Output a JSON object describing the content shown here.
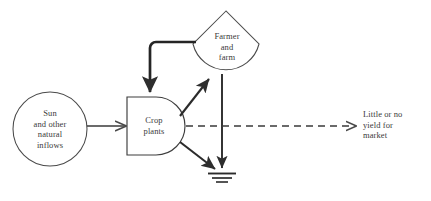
{
  "diagram": {
    "type": "energy-systems-language",
    "background_color": "#ffffff",
    "line_color": "#2e2e2e",
    "text_color": "#3a3a3a",
    "nodes": [
      {
        "id": "source",
        "symbol": "circle-source",
        "label": "Sun\nand other\nnatural\ninflows",
        "lines": [
          "Sun",
          "and other",
          "natural",
          "inflows"
        ]
      },
      {
        "id": "producer",
        "symbol": "bullet-producer",
        "label": "Crop\nplants",
        "lines": [
          "Crop",
          "plants"
        ]
      },
      {
        "id": "consumer",
        "symbol": "hexagon-consumer",
        "label": "Farmer\nand\nfarm",
        "lines": [
          "Farmer",
          "and",
          "farm"
        ]
      },
      {
        "id": "heat-sink",
        "symbol": "ground-heat-sink",
        "label": ""
      },
      {
        "id": "yield",
        "symbol": "text-label",
        "label": "Little or no\nyield for\nmarket",
        "lines": [
          "Little or no",
          "yield for",
          "market"
        ]
      }
    ],
    "flows": [
      {
        "id": "source-to-producer",
        "from": "source",
        "to": "producer",
        "style": "solid",
        "arrow": true
      },
      {
        "id": "producer-to-consumer",
        "from": "producer",
        "to": "consumer",
        "style": "solid",
        "arrow": true
      },
      {
        "id": "consumer-feedback-to-producer",
        "from": "consumer",
        "to": "producer",
        "style": "solid-thick",
        "arrow": true
      },
      {
        "id": "producer-to-heat-sink",
        "from": "producer",
        "to": "heat-sink",
        "style": "solid",
        "arrow": true
      },
      {
        "id": "consumer-to-heat-sink",
        "from": "consumer",
        "to": "heat-sink",
        "style": "solid",
        "arrow": true
      },
      {
        "id": "producer-to-yield",
        "from": "producer",
        "to": "yield",
        "style": "dashed",
        "arrow": true
      }
    ]
  }
}
